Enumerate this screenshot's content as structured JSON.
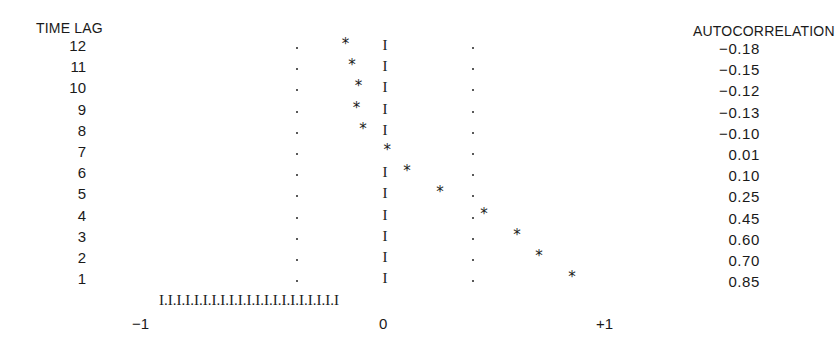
{
  "chart_data": {
    "type": "correlogram",
    "title": "",
    "xlabel": "",
    "ylabel": "TIME LAG",
    "value_column_header": "AUTOCORRELATION",
    "xlim": [
      -1,
      1
    ],
    "x_tick_labels": [
      "-1",
      "0",
      "+1"
    ],
    "confidence_band": [
      -0.4,
      0.4
    ],
    "lags": [
      12,
      11,
      10,
      9,
      8,
      7,
      6,
      5,
      4,
      3,
      2,
      1
    ],
    "values": [
      -0.18,
      -0.15,
      -0.12,
      -0.13,
      -0.1,
      0.01,
      0.1,
      0.25,
      0.45,
      0.6,
      0.7,
      0.85
    ],
    "value_labels": [
      "−0.18",
      "−0.15",
      "−0.12",
      "−0.13",
      "−0.10",
      "0.01",
      "0.10",
      "0.25",
      "0.45",
      "0.60",
      "0.70",
      "0.85"
    ],
    "axis_string": "I.I.I.I.I.I.I.I.I.I.I.I.I.I.I.I.I.I.I.I.I",
    "zero_marker": "I",
    "point_marker": "*",
    "band_marker": "."
  },
  "labels": {
    "time_lag_header": "TIME LAG",
    "autocorrelation_header": "AUTOCORRELATION",
    "x_min": "−1",
    "x_zero": "0",
    "x_max": "+1"
  }
}
